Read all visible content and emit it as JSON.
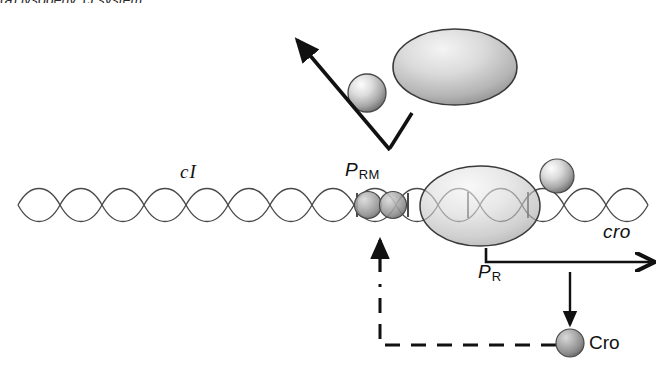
{
  "figure": {
    "title_fragment": "(a)  lysogeny, cI  system"
  },
  "labels": {
    "gene_ci": "cI",
    "gene_cro": "cro",
    "promoter_rm_base": "P",
    "promoter_rm_sub": "RM",
    "promoter_r_base": "P",
    "promoter_r_sub": "R",
    "protein_cro": "Cro"
  },
  "elements": {
    "dna": {
      "name": "dna-double-helix",
      "start_x": 18,
      "end_x": 652,
      "axis_y": 205
    },
    "ci_dimer": {
      "name": "ci-repressor-dimer",
      "count": 2,
      "cx": [
        368,
        393
      ],
      "cy": 205,
      "r": 13
    },
    "rna_polymerase": {
      "name": "rna-polymerase-ellipse",
      "cx": 480,
      "cy": 206,
      "rx": 60,
      "ry": 40
    },
    "polymerase_subunit": {
      "name": "polymerase-subunit-sphere",
      "cx": 557,
      "cy": 176,
      "r": 17
    },
    "ci_dimer_free": {
      "name": "free-ci-dimer-large",
      "cx": 455,
      "cy": 67,
      "rx": 62,
      "ry": 38
    },
    "ci_monomer_free": {
      "name": "free-ci-monomer-small",
      "cx": 367,
      "cy": 93,
      "r": 19
    },
    "cro_protein": {
      "name": "cro-protein-sphere",
      "cx": 570,
      "cy": 343,
      "r": 14
    }
  },
  "colors": {
    "ink": "#111111",
    "dna_stroke": "#4a4a4a",
    "sphere_light": "#f2f2f2",
    "sphere_mid": "#b9b9b9",
    "sphere_dark": "#6f6f6f",
    "dimer_dark": "#8d8d8d",
    "outline": "#3a3a3a"
  }
}
